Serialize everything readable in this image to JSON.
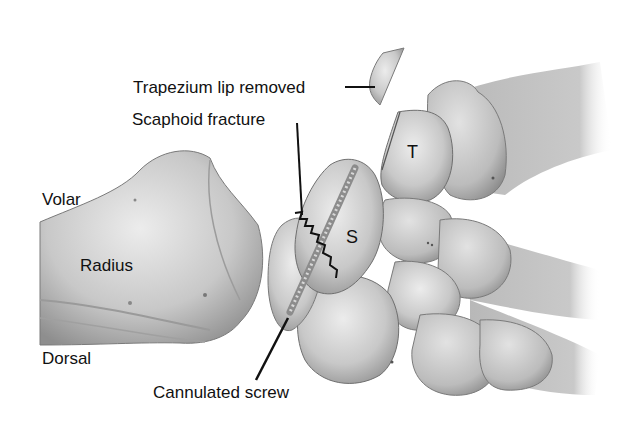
{
  "figure": {
    "colors": {
      "background": "#ffffff",
      "bone_light": "#e4e4e4",
      "bone_mid": "#bdbdbd",
      "bone_dark": "#8a8a8a",
      "outline": "#6a6a6a",
      "leader_line": "#111111",
      "text": "#111111"
    }
  },
  "labels": {
    "trapezium_lip": "Trapezium lip removed",
    "scaphoid_fracture": "Scaphoid fracture",
    "volar": "Volar",
    "radius": "Radius",
    "dorsal": "Dorsal",
    "cannulated_screw": "Cannulated screw",
    "scaphoid_letter": "S",
    "trapezium_letter": "T"
  }
}
